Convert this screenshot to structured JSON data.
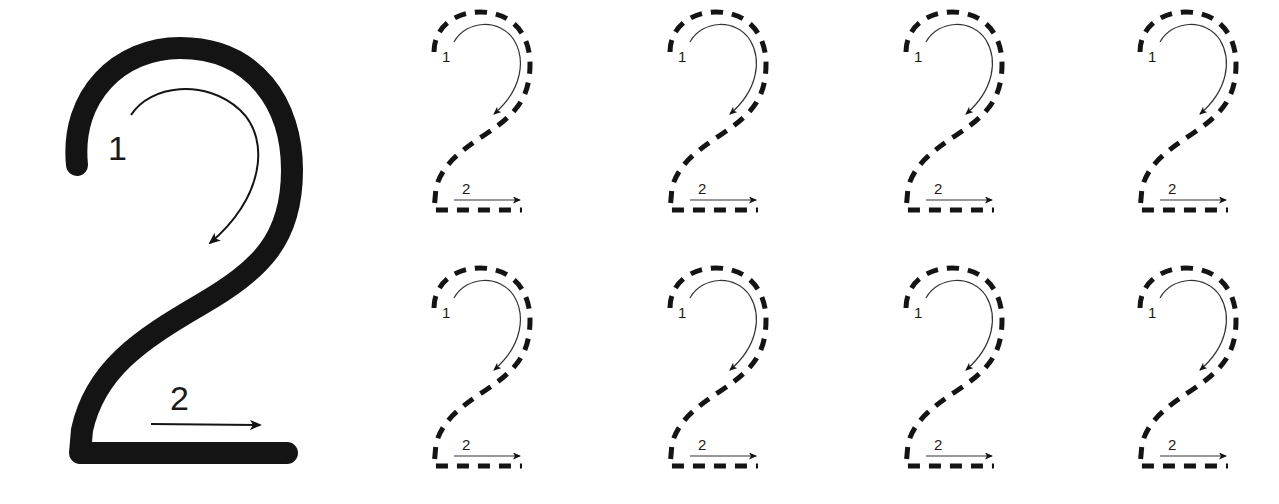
{
  "worksheet": {
    "digit": "2",
    "ink_color": "#141414",
    "background": "#ffffff",
    "model": {
      "stroke_1_label": "1",
      "stroke_2_label": "2"
    },
    "tracing_rows": [
      {
        "items": [
          {
            "stroke_1_label": "1",
            "stroke_2_label": "2"
          },
          {
            "stroke_1_label": "1",
            "stroke_2_label": "2"
          },
          {
            "stroke_1_label": "1",
            "stroke_2_label": "2"
          },
          {
            "stroke_1_label": "1",
            "stroke_2_label": "2"
          }
        ]
      },
      {
        "items": [
          {
            "stroke_1_label": "1",
            "stroke_2_label": "2"
          },
          {
            "stroke_1_label": "1",
            "stroke_2_label": "2"
          },
          {
            "stroke_1_label": "1",
            "stroke_2_label": "2"
          },
          {
            "stroke_1_label": "1",
            "stroke_2_label": "2"
          }
        ]
      }
    ]
  }
}
